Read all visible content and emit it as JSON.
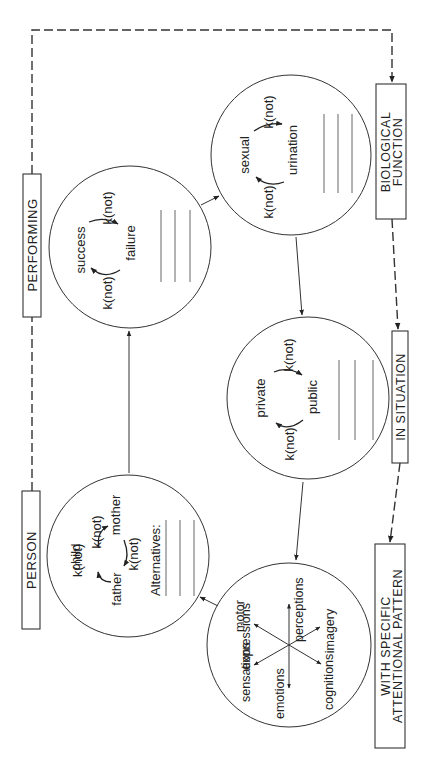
{
  "diagram": {
    "orientation": "rotated -90deg (text reads bottom-to-top)",
    "boxes": {
      "person": "PERSON",
      "performing": "PERFORMING",
      "biological": [
        "BIOLOGICAL",
        "FUNCTION"
      ],
      "situation": "IN SITUATION",
      "attentional": [
        "WITH SPECIFIC",
        "ATTENTIONAL PATTERN"
      ]
    },
    "circles": {
      "person": {
        "nodes": {
          "child": "child",
          "mother": "mother",
          "father": "father"
        },
        "transitions": [
          "k(not)",
          "k(not)",
          "k(not)"
        ],
        "alternatives_label": "Alternatives:",
        "blank_lines": 3
      },
      "performing": {
        "nodes": {
          "a": "success",
          "b": "failure"
        },
        "transitions": [
          "k(not)",
          "k(not)"
        ],
        "blank_lines": 3
      },
      "biological": {
        "nodes": {
          "a": "sexual",
          "b": "urination"
        },
        "transitions": [
          "k(not)",
          "k(not)"
        ],
        "blank_lines": 3
      },
      "situation": {
        "nodes": {
          "a": "private",
          "b": "public"
        },
        "transitions": [
          "k(not)",
          "k(not)"
        ],
        "blank_lines": 3
      },
      "attentional": {
        "rays": {
          "motor": "motor",
          "expressions": "expressions",
          "perceptions": "perceptions",
          "imagery": "imagery",
          "sensations": "sensations",
          "emotions": "emotions",
          "cognitions": "cognitions"
        }
      }
    },
    "flow": [
      "person -> performing",
      "performing -> biological",
      "biological -> situation",
      "situation -> attentional",
      "attentional -> person"
    ],
    "dashed_flow": [
      "PERSON -- PERFORMING",
      "PERFORMING -- BIOLOGICAL FUNCTION",
      "BIOLOGICAL FUNCTION -- IN SITUATION",
      "IN SITUATION -- WITH SPECIFIC ATTENTIONAL PATTERN"
    ],
    "colors": {
      "ink": "#222222",
      "background": "#ffffff"
    }
  }
}
